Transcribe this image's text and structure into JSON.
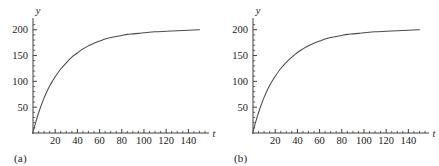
{
  "figure": {
    "background_color": "#ffffff",
    "curve_color": "#4a4a4a",
    "axis_color": "#2a2a2a"
  },
  "panels": [
    {
      "caption": "(a)",
      "xlabel": "t",
      "ylabel": "y"
    },
    {
      "caption": "(b)",
      "xlabel": "t",
      "ylabel": "y"
    }
  ],
  "chart_data": [
    {
      "type": "line",
      "title": "",
      "subtitle": "",
      "caption": "(a)",
      "xlabel": "t",
      "ylabel": "y",
      "xlim": [
        0,
        155
      ],
      "ylim": [
        0,
        215
      ],
      "xticks": [
        20,
        40,
        60,
        80,
        100,
        120,
        140
      ],
      "xtick_labels": [
        "20",
        "40",
        "60",
        "80",
        "100",
        "120",
        "140"
      ],
      "yticks": [
        50,
        100,
        150,
        200
      ],
      "ytick_labels": [
        "50",
        "100",
        "150",
        "200"
      ],
      "x_minor_tick_step": 5,
      "y_minor_tick_step": 10,
      "grid": false,
      "legend": false,
      "asymptote": 200,
      "series": [
        {
          "name": "y(t)",
          "color": "#4a4a4a",
          "x": [
            0,
            2,
            4,
            6,
            8,
            10,
            12,
            15,
            18,
            20,
            25,
            30,
            35,
            40,
            45,
            50,
            55,
            60,
            65,
            70,
            75,
            80,
            85,
            90,
            95,
            100,
            110,
            120,
            130,
            140,
            150
          ],
          "y": [
            2,
            17,
            32,
            45,
            57,
            68,
            78,
            91,
            102,
            109,
            124,
            136,
            147,
            155,
            163,
            169,
            174,
            178,
            182,
            185,
            187,
            189,
            191,
            192,
            193,
            194,
            196,
            197,
            198,
            199,
            200
          ]
        }
      ]
    },
    {
      "type": "line",
      "title": "",
      "subtitle": "",
      "caption": "(b)",
      "xlabel": "t",
      "ylabel": "y",
      "xlim": [
        0,
        155
      ],
      "ylim": [
        0,
        215
      ],
      "xticks": [
        20,
        40,
        60,
        80,
        100,
        120,
        140
      ],
      "xtick_labels": [
        "20",
        "40",
        "60",
        "80",
        "100",
        "120",
        "140"
      ],
      "yticks": [
        50,
        100,
        150,
        200
      ],
      "ytick_labels": [
        "50",
        "100",
        "150",
        "200"
      ],
      "x_minor_tick_step": 5,
      "y_minor_tick_step": 10,
      "grid": false,
      "legend": false,
      "asymptote": 200,
      "series": [
        {
          "name": "y(t)",
          "color": "#4a4a4a",
          "x": [
            0,
            2,
            4,
            6,
            8,
            10,
            12,
            15,
            18,
            20,
            25,
            30,
            35,
            40,
            45,
            50,
            55,
            60,
            65,
            70,
            75,
            80,
            85,
            90,
            95,
            100,
            110,
            120,
            130,
            140,
            150
          ],
          "y": [
            3,
            18,
            33,
            46,
            58,
            69,
            79,
            92,
            103,
            110,
            125,
            137,
            147,
            156,
            163,
            169,
            174,
            178,
            182,
            185,
            187,
            189,
            191,
            192,
            193,
            194,
            196,
            197,
            198,
            199,
            200
          ]
        }
      ]
    }
  ]
}
